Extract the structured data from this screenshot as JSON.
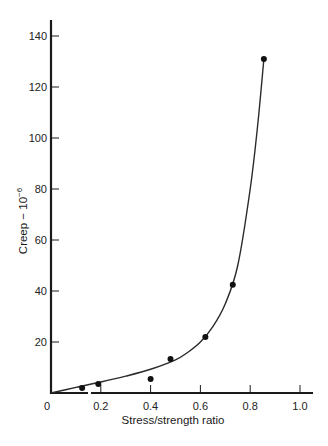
{
  "chart_data": {
    "type": "scatter",
    "title": "",
    "xlabel": "Stress/strength ratio",
    "ylabel": "Creep − 10",
    "ylabel_exponent": "−6",
    "xlim": [
      0,
      1.05
    ],
    "ylim": [
      0,
      147
    ],
    "grid": false,
    "legend": null,
    "x_ticks": [
      0.2,
      0.4,
      0.6,
      0.8,
      1.0
    ],
    "x_tick_labels": [
      "0.2",
      "0.4",
      "0.6",
      "0.8",
      "1.0"
    ],
    "y_ticks": [
      20,
      40,
      60,
      80,
      100,
      120,
      140
    ],
    "y_tick_labels": [
      "20",
      "40",
      "60",
      "80",
      "100",
      "120",
      "140"
    ],
    "origin_label": "0",
    "series": [
      {
        "name": "Measured creep",
        "type": "scatter",
        "x": [
          0.125,
          0.19,
          0.4,
          0.48,
          0.62,
          0.73,
          0.855
        ],
        "y": [
          2,
          3.5,
          5.5,
          13.3,
          22,
          42.5,
          131
        ]
      },
      {
        "name": "Fitted curve",
        "type": "line",
        "x": [
          0,
          0.1,
          0.2,
          0.3,
          0.4,
          0.5,
          0.55,
          0.6,
          0.65,
          0.7,
          0.75,
          0.8,
          0.83,
          0.855
        ],
        "y": [
          0,
          2.2,
          4.3,
          6.6,
          9.3,
          13,
          16,
          20,
          26,
          35,
          50,
          80,
          105,
          131
        ]
      }
    ]
  },
  "colors": {
    "axis": "#1a1a1a",
    "curve": "#2a2a2a",
    "points": "#111111",
    "background": "#ffffff"
  }
}
